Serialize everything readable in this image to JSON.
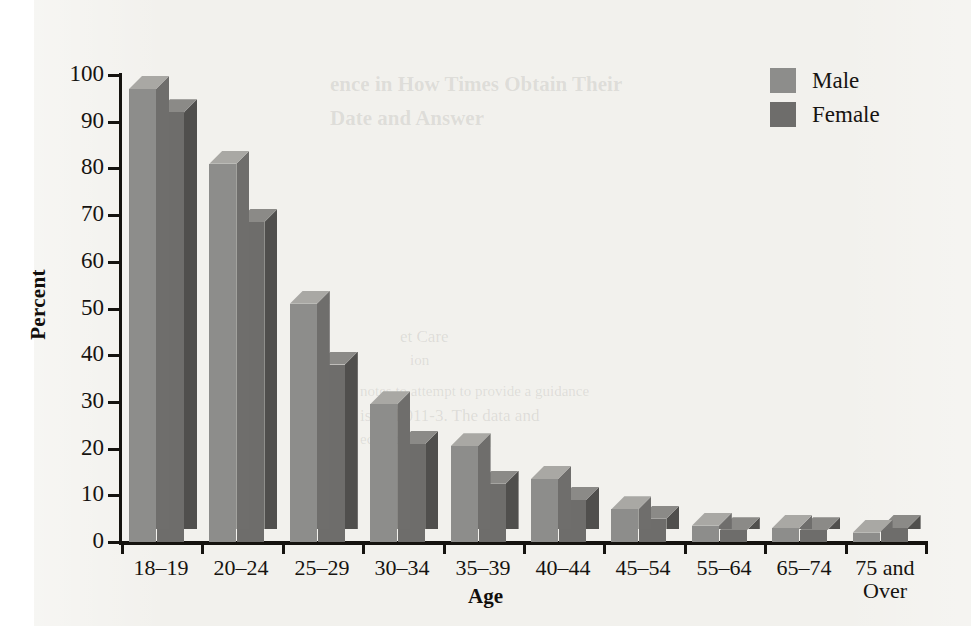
{
  "chart_data": {
    "type": "bar",
    "title": "",
    "subtitle": "",
    "xlabel": "Age",
    "ylabel": "Percent",
    "ylim": [
      0,
      100
    ],
    "yticks": [
      0,
      10,
      20,
      30,
      40,
      50,
      60,
      70,
      80,
      90,
      100
    ],
    "grid": false,
    "legend_position": "top-right",
    "style": "3d-bar",
    "categories": [
      "18–19",
      "20–24",
      "25–29",
      "30–34",
      "35–39",
      "40–44",
      "45–54",
      "55–64",
      "65–74",
      "75 and\nOver"
    ],
    "series": [
      {
        "name": "Male",
        "color": "#8d8d8b",
        "values": [
          97,
          81,
          51,
          29.5,
          20.5,
          13.5,
          7,
          3.5,
          3,
          2
        ]
      },
      {
        "name": "Female",
        "color": "#6e6d6b",
        "values": [
          92,
          68.5,
          38,
          21,
          12.5,
          9,
          5,
          2.5,
          2.5,
          3
        ]
      }
    ]
  },
  "legend": {
    "items": [
      {
        "label": "Male",
        "color": "#8d8d8b"
      },
      {
        "label": "Female",
        "color": "#6e6d6b"
      }
    ]
  },
  "axes": {
    "y_title": "Percent",
    "x_title": "Age",
    "y_tick_labels": [
      "100",
      "90",
      "80",
      "70",
      "60",
      "50",
      "40",
      "30",
      "20",
      "10",
      "0"
    ],
    "x_tick_labels": [
      "18–19",
      "20–24",
      "25–29",
      "30–34",
      "35–39",
      "40–44",
      "45–54",
      "55–64",
      "65–74",
      "75 and Over"
    ]
  },
  "page_background": {
    "show_through_text": [
      "ence in How Times Obtain Their",
      "Date and Answer",
      "et Care",
      "ion",
      "notes to attempt to provide a guidance",
      "is call 011-3. The data and",
      "education."
    ]
  }
}
